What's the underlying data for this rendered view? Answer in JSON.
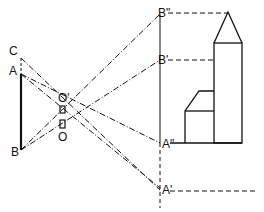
{
  "diagram": {
    "type": "pinhole camera projection",
    "labels": {
      "C": "C",
      "A": "A",
      "B": "B",
      "O_prime": "O'",
      "O": "O",
      "B_double_prime": "B\"",
      "B_prime": "B'",
      "A_double_prime": "A\"",
      "A_prime": "A'"
    },
    "colors": {
      "line": "#111111",
      "background": "#ffffff"
    }
  }
}
